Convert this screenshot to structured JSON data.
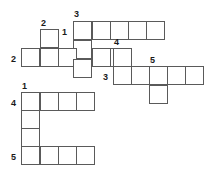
{
  "puzzle": {
    "type": "crossword-grid",
    "title": "Crossword Puzzle Grid",
    "colors": {
      "cell_border": "#5a5a5a",
      "cell_fill": "#ffffff",
      "number_text": "#1a1a1a",
      "background": "#ffffff"
    },
    "cell_size": 19,
    "grid_columns": 10,
    "grid_rows": 8,
    "entries": [
      {
        "number": "3",
        "direction": "across",
        "length": 5,
        "start": {
          "col": 3,
          "row": 0
        }
      },
      {
        "number": "1",
        "direction": "down",
        "length": 5,
        "start": {
          "col": 3,
          "row": 0
        }
      },
      {
        "number": "2",
        "direction": "down",
        "length": 2,
        "start": {
          "col": 1,
          "row": 1
        }
      },
      {
        "number": "2",
        "direction": "across",
        "length": 6,
        "start": {
          "col": 0,
          "row": 2
        }
      },
      {
        "number": "4",
        "direction": "down",
        "length": 2,
        "start": {
          "col": 5,
          "row": 2
        }
      },
      {
        "number": "3",
        "direction": "across",
        "length": 5,
        "start": {
          "col": 5,
          "row": 3
        }
      },
      {
        "number": "5",
        "direction": "down",
        "length": 2,
        "start": {
          "col": 7,
          "row": 3
        }
      },
      {
        "number": "1",
        "direction": "across",
        "length": 4,
        "start": {
          "col": 0,
          "row": 4
        }
      },
      {
        "number": "4",
        "direction": "down",
        "length": 4,
        "start": {
          "col": 0,
          "row": 4
        }
      },
      {
        "number": "5",
        "direction": "across",
        "length": 4,
        "start": {
          "col": 0,
          "row": 7
        }
      }
    ],
    "cells": [
      {
        "id": "c-r0-3",
        "col": 3,
        "row": 0,
        "x": 73,
        "y": 21
      },
      {
        "id": "c-r0-4",
        "col": 4,
        "row": 0,
        "x": 92,
        "y": 21
      },
      {
        "id": "c-r0-5",
        "col": 5,
        "row": 0,
        "x": 110,
        "y": 21
      },
      {
        "id": "c-r0-6",
        "col": 6,
        "row": 0,
        "x": 128,
        "y": 21
      },
      {
        "id": "c-r0-7",
        "col": 7,
        "row": 0,
        "x": 146,
        "y": 21
      },
      {
        "id": "c-r1-1",
        "col": 1,
        "row": 1,
        "x": 40,
        "y": 29
      },
      {
        "id": "c-r1-3",
        "col": 3,
        "row": 1,
        "x": 73,
        "y": 40
      },
      {
        "id": "c-r2-0",
        "col": 0,
        "row": 2,
        "x": 21,
        "y": 48
      },
      {
        "id": "c-r2-1",
        "col": 1,
        "row": 2,
        "x": 40,
        "y": 48
      },
      {
        "id": "c-r2-2",
        "col": 2,
        "row": 2,
        "x": 58,
        "y": 48
      },
      {
        "id": "c-r2-3",
        "col": 3,
        "row": 2,
        "x": 73,
        "y": 59
      },
      {
        "id": "c-r2-4",
        "col": 4,
        "row": 2,
        "x": 92,
        "y": 48
      },
      {
        "id": "c-r2-5",
        "col": 5,
        "row": 2,
        "x": 110,
        "y": 48
      },
      {
        "id": "c-r2-6",
        "col": 6,
        "row": 2,
        "x": 113,
        "y": 48
      },
      {
        "id": "c-r3-5",
        "col": 5,
        "row": 3,
        "x": 113,
        "y": 66
      },
      {
        "id": "c-r3-6",
        "col": 6,
        "row": 3,
        "x": 131,
        "y": 66
      },
      {
        "id": "c-r3-7",
        "col": 7,
        "row": 3,
        "x": 149,
        "y": 66
      },
      {
        "id": "c-r3-8",
        "col": 8,
        "row": 3,
        "x": 167,
        "y": 66
      },
      {
        "id": "c-r3-9",
        "col": 9,
        "row": 3,
        "x": 185,
        "y": 66
      },
      {
        "id": "c-r4-7",
        "col": 7,
        "row": 4,
        "x": 149,
        "y": 85
      },
      {
        "id": "c-r4-0",
        "col": 0,
        "row": 4,
        "x": 21,
        "y": 92
      },
      {
        "id": "c-r4-1",
        "col": 1,
        "row": 4,
        "x": 40,
        "y": 92
      },
      {
        "id": "c-r4-2",
        "col": 2,
        "row": 4,
        "x": 58,
        "y": 92
      },
      {
        "id": "c-r4-3",
        "col": 3,
        "row": 4,
        "x": 76,
        "y": 92
      },
      {
        "id": "c-r5-0",
        "col": 0,
        "row": 5,
        "x": 21,
        "y": 110
      },
      {
        "id": "c-r6-0",
        "col": 0,
        "row": 6,
        "x": 21,
        "y": 128
      },
      {
        "id": "c-r7-0",
        "col": 0,
        "row": 7,
        "x": 21,
        "y": 146
      },
      {
        "id": "c-r7-1",
        "col": 1,
        "row": 7,
        "x": 40,
        "y": 146
      },
      {
        "id": "c-r7-2",
        "col": 2,
        "row": 7,
        "x": 58,
        "y": 146
      },
      {
        "id": "c-r7-3",
        "col": 3,
        "row": 7,
        "x": 76,
        "y": 146
      }
    ],
    "numbers": [
      {
        "id": "n-3-top",
        "label": "3",
        "x": 74,
        "y": 10
      },
      {
        "id": "n-2-top",
        "label": "2",
        "x": 41,
        "y": 19
      },
      {
        "id": "n-1-top",
        "label": "1",
        "x": 62,
        "y": 28
      },
      {
        "id": "n-4-mid",
        "label": "4",
        "x": 114,
        "y": 38
      },
      {
        "id": "n-2-left",
        "label": "2",
        "x": 11,
        "y": 55
      },
      {
        "id": "n-5-right",
        "label": "5",
        "x": 150,
        "y": 56
      },
      {
        "id": "n-3-mid",
        "label": "3",
        "x": 103,
        "y": 73
      },
      {
        "id": "n-1-low",
        "label": "1",
        "x": 22,
        "y": 82
      },
      {
        "id": "n-4-left",
        "label": "4",
        "x": 11,
        "y": 99
      },
      {
        "id": "n-5-bottom",
        "label": "5",
        "x": 11,
        "y": 153
      }
    ]
  }
}
